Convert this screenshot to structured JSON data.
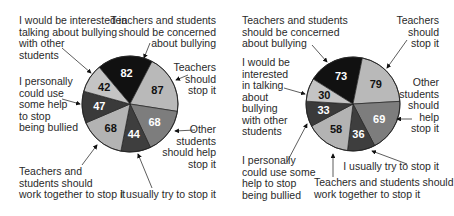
{
  "chart_data": [
    {
      "type": "pie",
      "title": "",
      "categories": [
        "Teachers and students should be concerned about bullying",
        "Teachers should stop it",
        "Other students should help stop it",
        "I usually try to stop it",
        "Teachers and students should work together to stop it",
        "I personally could use some help to stop being bullied",
        "I would be interested in talking about bullying with other students"
      ],
      "values": [
        82,
        87,
        68,
        44,
        68,
        47,
        42
      ],
      "colors": [
        "#111111",
        "#b9b9b9",
        "#7d7d7d",
        "#3e3e3e",
        "#b3b3b3",
        "#3a3a3a",
        "#c4c4c4"
      ],
      "label_colors": [
        "#ffffff",
        "#111111",
        "#ffffff",
        "#ffffff",
        "#111111",
        "#ffffff",
        "#111111"
      ],
      "start_angle_deg": -40
    },
    {
      "type": "pie",
      "title": "",
      "categories": [
        "Teachers and students should be concerned about bullying",
        "Teachers should stop it",
        "Other students should help stop it",
        "I usually try to stop it",
        "Teachers and students should work together to stop it",
        "I personally could use some help to stop being bullied",
        "I would be interested in talking about bullying with other students"
      ],
      "values": [
        73,
        79,
        69,
        36,
        58,
        33,
        30
      ],
      "colors": [
        "#111111",
        "#b9b9b9",
        "#7d7d7d",
        "#3e3e3e",
        "#b3b3b3",
        "#3a3a3a",
        "#c4c4c4"
      ],
      "label_colors": [
        "#ffffff",
        "#111111",
        "#ffffff",
        "#ffffff",
        "#111111",
        "#ffffff",
        "#111111"
      ],
      "start_angle_deg": -58
    }
  ],
  "left": {
    "labels": {
      "interested": "I would be interested in\ntalking about bullying\nwith other\nstudents",
      "concerned": "Teachers and students\nshould be concerned\nabout bullying",
      "teachers": "Teachers\nshould\nstop it",
      "help": "I personally\ncould use\nsome help\nto stop\nbeing bullied",
      "others": "Other\nstudents\nshould help\nstop it",
      "together": "Teachers and\nstudents should\nwork together to stop it",
      "usually": "I usually try to stop it"
    }
  },
  "right": {
    "labels": {
      "concerned": "Teachers and students\nshould be concerned\nabout bullying",
      "teachers": "Teachers\nshould\nstop it",
      "interested": "I would be\ninterested\nin talking\nabout\nbullying\nwith other\nstudents",
      "others": "Other\nstudents\nshould\nhelp\nstop it",
      "usually": "I usually try to stop it",
      "together": "Teachers and students should\nwork together to stop it",
      "help": "I personally\ncould use some\nhelp to stop\nbeing bullied"
    }
  }
}
